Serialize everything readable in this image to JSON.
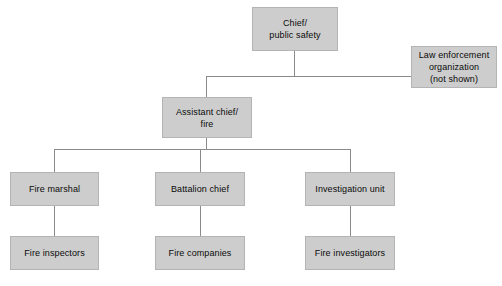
{
  "diagram": {
    "type": "org-chart",
    "colors": {
      "node_fill": "#cdcdcd",
      "node_border": "#b4b4b4",
      "connector": "#8a8a8a",
      "text": "#0a0a0a",
      "background": "#ffffff"
    },
    "nodes": {
      "chief": {
        "label": "Chief/\npublic safety",
        "level": 1
      },
      "law_enforcement": {
        "label": "Law enforcement\norganization\n(not shown)",
        "level": 2
      },
      "assistant_chief": {
        "label": "Assistant chief/\nfire",
        "level": 2
      },
      "fire_marshal": {
        "label": "Fire marshal",
        "level": 3
      },
      "battalion_chief": {
        "label": "Battalion chief",
        "level": 3
      },
      "investigation_unit": {
        "label": "Investigation unit",
        "level": 3
      },
      "fire_inspectors": {
        "label": "Fire inspectors",
        "level": 4
      },
      "fire_companies": {
        "label": "Fire companies",
        "level": 4
      },
      "fire_investigators": {
        "label": "Fire investigators",
        "level": 4
      }
    },
    "edges": [
      {
        "from": "chief",
        "to": "assistant_chief"
      },
      {
        "from": "chief",
        "to": "law_enforcement"
      },
      {
        "from": "assistant_chief",
        "to": "fire_marshal"
      },
      {
        "from": "assistant_chief",
        "to": "battalion_chief"
      },
      {
        "from": "assistant_chief",
        "to": "investigation_unit"
      },
      {
        "from": "fire_marshal",
        "to": "fire_inspectors"
      },
      {
        "from": "battalion_chief",
        "to": "fire_companies"
      },
      {
        "from": "investigation_unit",
        "to": "fire_investigators"
      }
    ]
  }
}
